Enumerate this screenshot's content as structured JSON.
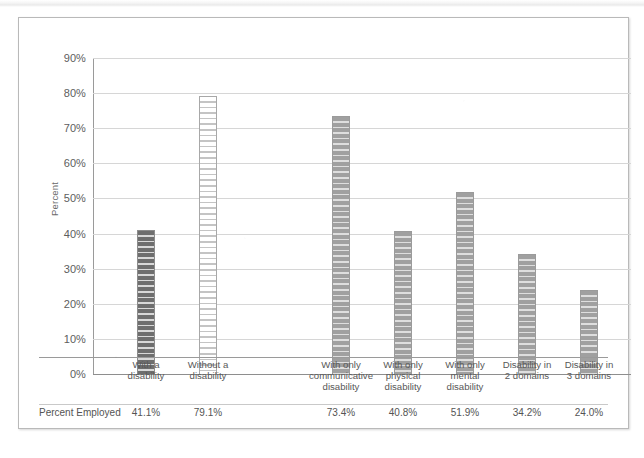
{
  "figure": {
    "y_axis_title": "Percent",
    "caption": ""
  },
  "chart_data": {
    "type": "bar",
    "title": "",
    "xlabel": "",
    "ylabel": "Percent",
    "ylim": [
      0,
      90
    ],
    "grid": true,
    "legend": "none",
    "categories": [
      "With a disability",
      "Without a disability",
      "With only communicative disability",
      "With only physical disability",
      "With only mental disability",
      "Disability in 2 domains",
      "Disability in 3 domains"
    ],
    "category_lines": [
      [
        "With a",
        "disability"
      ],
      [
        "Without a",
        "disability"
      ],
      [
        "With only",
        "communicative",
        "disability"
      ],
      [
        "With only",
        "physical",
        "disability"
      ],
      [
        "With only",
        "mental",
        "disability"
      ],
      [
        "Disability in",
        "2 domains"
      ],
      [
        "Disability in",
        "3 domains"
      ]
    ],
    "series": [
      {
        "name": "Percent Employed",
        "values": [
          41.1,
          79.1,
          73.4,
          40.8,
          51.9,
          34.2,
          24.0
        ],
        "value_labels": [
          "41.1%",
          "79.1%",
          "73.4%",
          "40.8%",
          "51.9%",
          "34.2%",
          "24.0%"
        ],
        "bar_patterns": [
          "dark",
          "light",
          "medium",
          "medium",
          "medium",
          "medium",
          "medium"
        ]
      }
    ],
    "ytick_values": [
      0,
      10,
      20,
      30,
      40,
      50,
      60,
      70,
      80,
      90
    ],
    "ytick_labels": [
      "0%",
      "10%",
      "20%",
      "30%",
      "40%",
      "50%",
      "60%",
      "70%",
      "80%",
      "90%"
    ]
  },
  "colors": {
    "frame_border": "#b9b9b9",
    "gridline": "#d6d6d6",
    "axis": "#8e8e8e",
    "text": "#585858",
    "bar_dark": "#6e6e6e",
    "bar_light": "#ffffff",
    "bar_medium": "#a0a0a0"
  }
}
